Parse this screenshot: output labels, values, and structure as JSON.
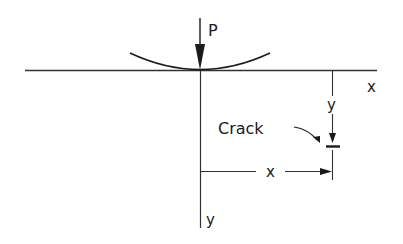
{
  "diagram": {
    "type": "contact-load-crack-geometry",
    "load_label": "P",
    "surface_axis_label": "x",
    "depth_axis_label": "y",
    "crack_label": "Crack",
    "crack_depth_label": "y",
    "crack_offset_label": "x",
    "colors": {
      "line": "#1a1a1a",
      "background": "#ffffff"
    }
  }
}
